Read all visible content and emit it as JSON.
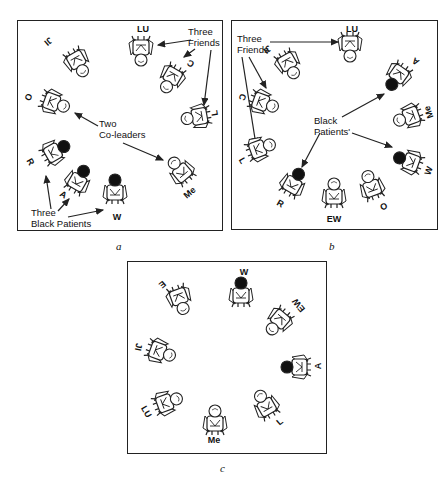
{
  "panels": [
    {
      "id": "a",
      "caption": "a",
      "box": {
        "x": 17,
        "y": 20,
        "w": 206,
        "h": 211
      },
      "people": [
        {
          "label": "JI",
          "x": 60,
          "y": 42,
          "rot": 150,
          "dark": false,
          "lx": 30,
          "ly": 20,
          "lrot": 140
        },
        {
          "label": "LU",
          "x": 123,
          "y": 30,
          "rot": 180,
          "dark": false,
          "lx": 125,
          "ly": 8,
          "lrot": 0
        },
        {
          "label": "C",
          "x": 153,
          "y": 58,
          "rot": 210,
          "dark": false,
          "lx": 173,
          "ly": 42,
          "lrot": 210
        },
        {
          "label": "L",
          "x": 178,
          "y": 96,
          "rot": 260,
          "dark": false,
          "lx": 197,
          "ly": 92,
          "lrot": 260
        },
        {
          "label": "O",
          "x": 37,
          "y": 82,
          "rot": 110,
          "dark": false,
          "lx": 10,
          "ly": 76,
          "lrot": 110
        },
        {
          "label": "R",
          "x": 38,
          "y": 130,
          "rot": 60,
          "dark": true,
          "lx": 12,
          "ly": 141,
          "lrot": 60
        },
        {
          "label": "A",
          "x": 61,
          "y": 158,
          "rot": 30,
          "dark": true,
          "lx": 45,
          "ly": 174,
          "lrot": 30
        },
        {
          "label": "W",
          "x": 97,
          "y": 168,
          "rot": 0,
          "dark": true,
          "lx": 99,
          "ly": 196,
          "lrot": 0
        },
        {
          "label": "Me",
          "x": 162,
          "y": 149,
          "rot": 320,
          "dark": false,
          "lx": 172,
          "ly": 172,
          "lrot": 320
        }
      ],
      "notes": [
        {
          "text_lines": [
            "Three",
            "Friends"
          ],
          "x": 170,
          "y": 6
        },
        {
          "text_lines": [
            "Two",
            "Co-leaders"
          ],
          "x": 81,
          "y": 98
        },
        {
          "text_lines": [
            "Three",
            "Black Patients"
          ],
          "x": 13,
          "y": 187
        }
      ],
      "arrows": [
        {
          "x1": 173,
          "y1": 19,
          "x2": 140,
          "y2": 24
        },
        {
          "x1": 177,
          "y1": 28,
          "x2": 166,
          "y2": 36
        },
        {
          "x1": 193,
          "y1": 29,
          "x2": 186,
          "y2": 84
        },
        {
          "x1": 80,
          "y1": 105,
          "x2": 57,
          "y2": 92
        },
        {
          "x1": 105,
          "y1": 122,
          "x2": 145,
          "y2": 139
        },
        {
          "x1": 33,
          "y1": 188,
          "x2": 28,
          "y2": 155
        },
        {
          "x1": 40,
          "y1": 190,
          "x2": 51,
          "y2": 178
        },
        {
          "x1": 50,
          "y1": 196,
          "x2": 85,
          "y2": 189
        }
      ]
    },
    {
      "id": "b",
      "caption": "b",
      "box": {
        "x": 231,
        "y": 20,
        "w": 207,
        "h": 210
      },
      "people": [
        {
          "label": "LU",
          "x": 118,
          "y": 26,
          "rot": 180,
          "dark": false,
          "lx": 120,
          "ly": 8,
          "lrot": 0
        },
        {
          "label": "JI",
          "x": 57,
          "y": 44,
          "rot": 150,
          "dark": false,
          "lx": 35,
          "ly": 28,
          "lrot": 140
        },
        {
          "label": "A",
          "x": 165,
          "y": 56,
          "rot": 215,
          "dark": true,
          "lx": 184,
          "ly": 40,
          "lrot": 215
        },
        {
          "label": "C",
          "x": 32,
          "y": 82,
          "rot": 110,
          "dark": false,
          "lx": 10,
          "ly": 76,
          "lrot": 110
        },
        {
          "label": "Me",
          "x": 176,
          "y": 96,
          "rot": 250,
          "dark": false,
          "lx": 197,
          "ly": 91,
          "lrot": 250
        },
        {
          "label": "L",
          "x": 29,
          "y": 127,
          "rot": 70,
          "dark": false,
          "lx": 10,
          "ly": 140,
          "lrot": 60
        },
        {
          "label": "W",
          "x": 176,
          "y": 140,
          "rot": 290,
          "dark": true,
          "lx": 197,
          "ly": 150,
          "lrot": 290
        },
        {
          "label": "R",
          "x": 62,
          "y": 161,
          "rot": 30,
          "dark": true,
          "lx": 48,
          "ly": 183,
          "lrot": 30
        },
        {
          "label": "EW",
          "x": 102,
          "y": 172,
          "rot": 0,
          "dark": false,
          "lx": 102,
          "ly": 198,
          "lrot": 0
        },
        {
          "label": "O",
          "x": 139,
          "y": 164,
          "rot": 340,
          "dark": false,
          "lx": 152,
          "ly": 186,
          "lrot": 340
        }
      ],
      "notes": [
        {
          "text_lines": [
            "Three",
            "Friends"
          ],
          "x": 5,
          "y": 13
        },
        {
          "text_lines": [
            "Black",
            "Patients'"
          ],
          "x": 82,
          "y": 95
        }
      ],
      "arrows": [
        {
          "x1": 38,
          "y1": 21,
          "x2": 106,
          "y2": 21
        },
        {
          "x1": 17,
          "y1": 36,
          "x2": 34,
          "y2": 67
        },
        {
          "x1": 10,
          "y1": 36,
          "x2": 24,
          "y2": 124
        },
        {
          "x1": 110,
          "y1": 96,
          "x2": 152,
          "y2": 73
        },
        {
          "x1": 120,
          "y1": 112,
          "x2": 160,
          "y2": 126
        },
        {
          "x1": 88,
          "y1": 112,
          "x2": 70,
          "y2": 146
        }
      ]
    },
    {
      "id": "c",
      "caption": "c",
      "box": {
        "x": 127,
        "y": 261,
        "w": 200,
        "h": 193
      },
      "people": [
        {
          "label": "W",
          "x": 113,
          "y": 30,
          "rot": 0,
          "dark": true,
          "lx": 116,
          "ly": 10,
          "lrot": 0
        },
        {
          "label": "E",
          "x": 52,
          "y": 38,
          "rot": 160,
          "dark": false,
          "lx": 34,
          "ly": 22,
          "lrot": 140
        },
        {
          "label": "EW",
          "x": 150,
          "y": 60,
          "rot": 220,
          "dark": false,
          "lx": 171,
          "ly": 43,
          "lrot": 230
        },
        {
          "label": "JI",
          "x": 33,
          "y": 90,
          "rot": 110,
          "dark": false,
          "lx": 10,
          "ly": 85,
          "lrot": 100
        },
        {
          "label": "A",
          "x": 168,
          "y": 105,
          "rot": 270,
          "dark": true,
          "lx": 190,
          "ly": 104,
          "lrot": 270
        },
        {
          "label": "LU",
          "x": 40,
          "y": 140,
          "rot": 70,
          "dark": false,
          "lx": 18,
          "ly": 150,
          "lrot": 60
        },
        {
          "label": "L",
          "x": 137,
          "y": 142,
          "rot": 330,
          "dark": false,
          "lx": 152,
          "ly": 160,
          "lrot": 320
        },
        {
          "label": "Me",
          "x": 87,
          "y": 158,
          "rot": 0,
          "dark": false,
          "lx": 86,
          "ly": 178,
          "lrot": 0
        }
      ],
      "notes": [],
      "arrows": []
    }
  ],
  "captions": [
    {
      "text": "a",
      "x": 116,
      "y": 240
    },
    {
      "text": "b",
      "x": 329,
      "y": 240
    },
    {
      "text": "c",
      "x": 220,
      "y": 462
    }
  ],
  "colors": {
    "line": "#222222",
    "dark_head": "#111111",
    "light_head": "#ffffff"
  }
}
